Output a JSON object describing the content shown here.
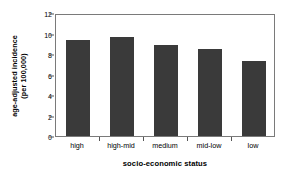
{
  "chart_data": {
    "type": "bar",
    "title": "",
    "categories": [
      "high",
      "high-mid",
      "medium",
      "mid-low",
      "low"
    ],
    "values": [
      9.4,
      9.7,
      8.9,
      8.5,
      7.3
    ],
    "series": [
      {
        "name": "age-adjusted incidence",
        "values": [
          9.4,
          9.7,
          8.9,
          8.5,
          7.3
        ]
      }
    ],
    "xlabel": "socio-economic status",
    "ylabel": "age-adjusted incidence (per 100,000)",
    "ylabel_line1": "age-adjusted incidence",
    "ylabel_line2": "(per 100,000)",
    "ylim": [
      0,
      12
    ],
    "yticks": [
      0,
      2,
      4,
      6,
      8,
      10,
      12
    ],
    "ytick_labels": [
      "0",
      "2",
      "4",
      "6",
      "8",
      "10",
      "12"
    ],
    "grid": false,
    "legend": false,
    "legend_position": "none",
    "bar_color": "#3a3a3a",
    "frame_color": "#7a7a7a",
    "background_color": "#ffffff"
  }
}
